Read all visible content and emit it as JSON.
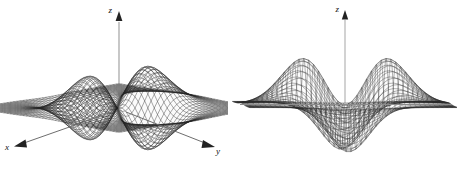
{
  "figure": {
    "title": "",
    "background_color": "#ffffff",
    "ink_color": "#1a1a1a",
    "panels": [
      {
        "id": "left",
        "view": "3d-perspective-surface",
        "axes": {
          "x_label": "x",
          "y_label": "y",
          "z_label": "z"
        }
      },
      {
        "id": "right",
        "view": "edge-on-profile",
        "axes": {
          "z_label": "z"
        }
      }
    ]
  },
  "chart_data": {
    "type": "line",
    "title": "",
    "subtitle": "",
    "xlabel": "x",
    "ylabel": "y",
    "zlabel": "z",
    "legend": [],
    "grid": false,
    "legend_position": "none",
    "surface": {
      "render": "wireframe-mesh",
      "mesh_lines_u": 46,
      "mesh_lines_v": 46,
      "xlim": [
        -4,
        4
      ],
      "ylim": [
        -4,
        4
      ],
      "zlim": [
        -1,
        1
      ],
      "peaks": [
        {
          "label": "peak-left",
          "x": -1.1,
          "y": 0.0,
          "z": 1.0
        },
        {
          "label": "peak-right",
          "x": 1.1,
          "y": 0.0,
          "z": 1.0
        }
      ],
      "troughs": [
        {
          "label": "trough-front",
          "x": 0.0,
          "y": -1.1,
          "z": -1.0
        },
        {
          "label": "trough-back",
          "x": 0.0,
          "y": 1.1,
          "z": -1.0
        }
      ],
      "flat_region_z": 0.0
    },
    "profile": {
      "x": [
        -4.0,
        -3.5,
        -3.0,
        -2.5,
        -2.2,
        -2.0,
        -1.8,
        -1.6,
        -1.4,
        -1.2,
        -1.1,
        -1.0,
        -0.8,
        -0.6,
        -0.4,
        -0.2,
        0.0,
        0.2,
        0.4,
        0.6,
        0.8,
        1.0,
        1.1,
        1.2,
        1.4,
        1.6,
        1.8,
        2.0,
        2.2,
        2.5,
        3.0,
        3.5,
        4.0
      ],
      "series": [
        {
          "name": "upper-profile",
          "values": [
            0.0,
            0.01,
            0.03,
            0.09,
            0.17,
            0.26,
            0.4,
            0.56,
            0.74,
            0.92,
            0.97,
            1.0,
            0.97,
            0.86,
            0.72,
            0.6,
            0.55,
            0.6,
            0.72,
            0.86,
            0.97,
            1.0,
            0.97,
            0.92,
            0.74,
            0.56,
            0.4,
            0.26,
            0.17,
            0.09,
            0.03,
            0.01,
            0.0
          ]
        },
        {
          "name": "lower-profile",
          "values": [
            0.0,
            -0.01,
            -0.03,
            -0.09,
            -0.17,
            -0.26,
            -0.4,
            -0.56,
            -0.74,
            -0.92,
            -0.97,
            -1.0,
            -0.97,
            -0.86,
            -0.72,
            -0.6,
            -0.1,
            -0.6,
            -0.72,
            -0.86,
            -0.97,
            -1.0,
            -0.97,
            -0.92,
            -0.74,
            -0.56,
            -0.4,
            -0.26,
            -0.17,
            -0.09,
            -0.03,
            -0.01,
            0.0
          ]
        }
      ]
    }
  }
}
